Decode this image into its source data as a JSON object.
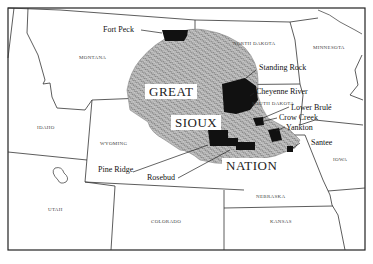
{
  "map": {
    "title": "Great Sioux Nation",
    "region_labels": [
      "GREAT",
      "SIOUX",
      "NATION"
    ],
    "states": [
      {
        "name": "MONTANA",
        "x": 80,
        "y": 55
      },
      {
        "name": "NORTH DAKOTA",
        "x": 234,
        "y": 41
      },
      {
        "name": "MINNESOTA",
        "x": 313,
        "y": 45
      },
      {
        "name": "SOUTH DAKOTA",
        "x": 252,
        "y": 101
      },
      {
        "name": "IDAHO",
        "x": 37,
        "y": 124
      },
      {
        "name": "WYOMING",
        "x": 101,
        "y": 141
      },
      {
        "name": "IOWA",
        "x": 334,
        "y": 157
      },
      {
        "name": "NEBRASKA",
        "x": 257,
        "y": 194
      },
      {
        "name": "UTAH",
        "x": 47,
        "y": 206
      },
      {
        "name": "COLORADO",
        "x": 151,
        "y": 219
      },
      {
        "name": "KANSAS",
        "x": 270,
        "y": 219
      }
    ],
    "reservations": [
      {
        "name": "Fort Peck",
        "x": 103,
        "y": 26
      },
      {
        "name": "Standing Rock",
        "x": 260,
        "y": 66
      },
      {
        "name": "Cheyenne River",
        "x": 256,
        "y": 89
      },
      {
        "name": "Lower Brulé",
        "x": 292,
        "y": 105
      },
      {
        "name": "Crow Creek",
        "x": 279,
        "y": 115
      },
      {
        "name": "Yankton",
        "x": 286,
        "y": 124
      },
      {
        "name": "Santee",
        "x": 311,
        "y": 140
      },
      {
        "name": "Pine Ridge",
        "x": 98,
        "y": 167
      },
      {
        "name": "Rosebud",
        "x": 147,
        "y": 174
      }
    ],
    "colors": {
      "border": "#222222",
      "reservation_fill": "#111111",
      "territory_hatch": "#555555",
      "background": "#ffffff"
    }
  }
}
